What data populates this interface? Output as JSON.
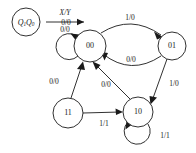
{
  "diagram": {
    "background_color": "#ffffff",
    "stroke_color": "#1a1a1a",
    "legend": {
      "node_name": "legend-state-node",
      "state_var_main": "Q",
      "state_var_sub_high": "1",
      "state_var_sub_low": "0",
      "state_label_full": "Q1Q0",
      "arrow_label_top": "X/Y",
      "arrow_label_bottom": "0/0"
    },
    "states": [
      {
        "id": "s00",
        "label": "00",
        "cx": 90,
        "cy": 46,
        "r": 16
      },
      {
        "id": "s01",
        "label": "01",
        "cx": 172,
        "cy": 46,
        "r": 14
      },
      {
        "id": "s11",
        "label": "11",
        "cx": 68,
        "cy": 113,
        "r": 15
      },
      {
        "id": "s10",
        "label": "10",
        "cx": 138,
        "cy": 112,
        "r": 15
      }
    ],
    "transitions": [
      {
        "id": "t-00-00",
        "from": "00",
        "to": "00",
        "input": "0",
        "output": "0",
        "label": "0/0",
        "kind": "self-loop",
        "label_x": 66,
        "label_y": 23
      },
      {
        "id": "t-00-01",
        "from": "00",
        "to": "01",
        "input": "1",
        "output": "0",
        "label": "1/0",
        "kind": "curve",
        "label_x": 130,
        "label_y": 18
      },
      {
        "id": "t-01-00",
        "from": "01",
        "to": "00",
        "input": "0",
        "output": "0",
        "label": "0/0",
        "kind": "curve",
        "label_x": 131,
        "label_y": 60
      },
      {
        "id": "t-01-10",
        "from": "01",
        "to": "10",
        "input": "1",
        "output": "0",
        "label": "1/0",
        "kind": "line",
        "label_x": 174,
        "label_y": 84
      },
      {
        "id": "t-11-00",
        "from": "11",
        "to": "00",
        "input": "0",
        "output": "0",
        "label": "0/0",
        "kind": "line",
        "label_x": 54,
        "label_y": 82
      },
      {
        "id": "t-10-00",
        "from": "10",
        "to": "00",
        "input": "0",
        "output": "0",
        "label": "0/0",
        "kind": "line",
        "label_x": 106,
        "label_y": 85
      },
      {
        "id": "t-11-10",
        "from": "11",
        "to": "10",
        "input": "1",
        "output": "1",
        "label": "1/1",
        "kind": "line",
        "label_x": 104,
        "label_y": 124
      },
      {
        "id": "t-10-10",
        "from": "10",
        "to": "10",
        "input": "1",
        "output": "1",
        "label": "1/1",
        "kind": "self-loop",
        "label_x": 165,
        "label_y": 136
      }
    ]
  }
}
